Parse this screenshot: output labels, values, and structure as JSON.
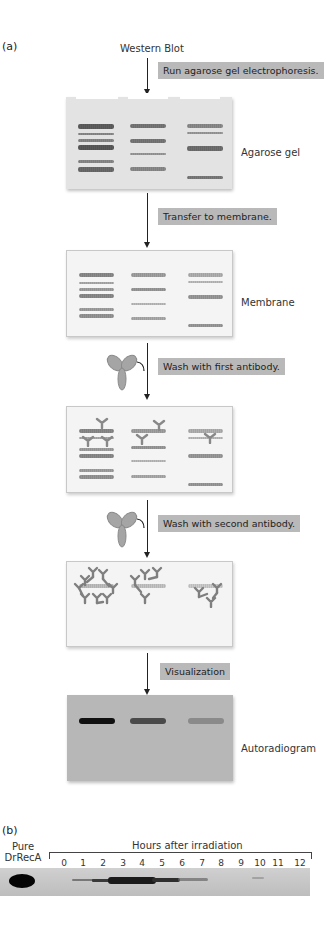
{
  "panel_a": {
    "label": "(a)",
    "title": "Western Blot",
    "steps": [
      {
        "label": "Run agarose gel electrophoresis."
      },
      {
        "label": "Transfer to membrane."
      },
      {
        "label": "Wash with first antibody."
      },
      {
        "label": "Wash with second antibody."
      },
      {
        "label": "Visualization"
      }
    ],
    "stages": [
      {
        "label": "Agarose gel"
      },
      {
        "label": "Membrane"
      },
      {
        "label": "Autoradiogram"
      }
    ]
  },
  "panel_b": {
    "label": "(b)",
    "control_label_line1": "Pure",
    "control_label_line2": "DrRecA",
    "axis_title": "Hours after irradiation",
    "hours": [
      "0",
      "1",
      "2",
      "3",
      "4",
      "5",
      "6",
      "7",
      "8",
      "9",
      "10",
      "11",
      "12"
    ]
  },
  "colors": {
    "step_box_bg": "#b9b9b9",
    "gel_bg": "#e3e3e3",
    "membrane_bg": "#f4f4f4",
    "autoradiogram_bg": "#b7b7b7"
  }
}
